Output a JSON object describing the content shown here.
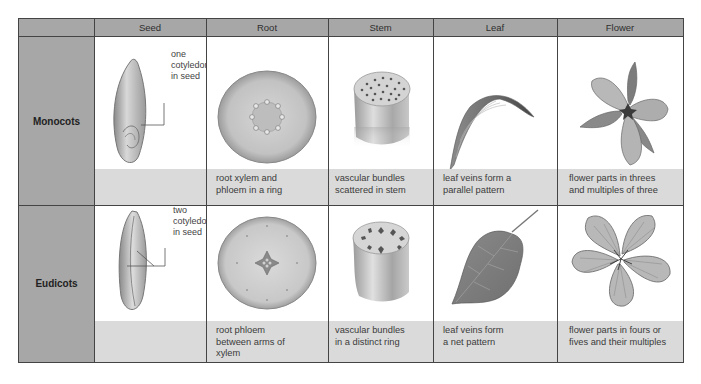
{
  "columns": [
    "Seed",
    "Root",
    "Stem",
    "Leaf",
    "Flower"
  ],
  "rows": [
    {
      "label": "Monocots",
      "seed_annotation": [
        "one",
        "cotyledon",
        "in seed"
      ],
      "captions": {
        "seed": "",
        "root": [
          "root xylem and",
          "phloem in a ring"
        ],
        "stem": [
          "vascular bundles",
          "scattered in stem"
        ],
        "leaf": [
          "leaf veins form a",
          "parallel pattern"
        ],
        "flower": [
          "flower parts in threes",
          "and multiples of three"
        ]
      },
      "icons": {
        "seed": "monocot-seed-icon",
        "root": "monocot-root-cross-section-icon",
        "stem": "monocot-stem-scattered-bundles-icon",
        "leaf": "parallel-vein-leaf-icon",
        "flower": "three-petal-flower-icon"
      }
    },
    {
      "label": "Eudicots",
      "seed_annotation": [
        "two",
        "cotyledons",
        "in seed"
      ],
      "captions": {
        "seed": "",
        "root": [
          "root phloem",
          "between arms of",
          "xylem"
        ],
        "stem": [
          "vascular bundles",
          "in a distinct ring"
        ],
        "leaf": [
          "leaf veins form",
          "a net pattern"
        ],
        "flower": [
          "flower parts in fours or",
          "fives and their multiples"
        ]
      },
      "icons": {
        "seed": "eudicot-seed-icon",
        "root": "eudicot-root-cross-section-icon",
        "stem": "eudicot-stem-ring-bundles-icon",
        "leaf": "net-vein-leaf-icon",
        "flower": "five-petal-flower-icon"
      }
    }
  ],
  "colors": {
    "header_bg": "#a7a7a7",
    "caption_bg": "#dadada",
    "border": "#444444"
  }
}
